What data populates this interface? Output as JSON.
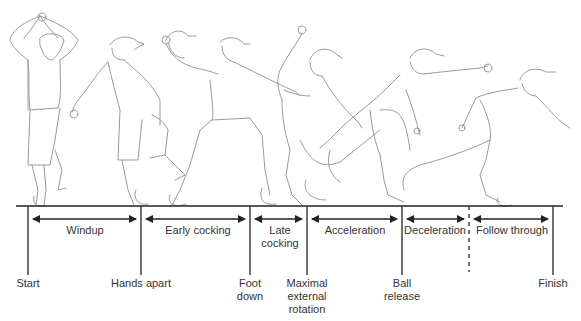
{
  "colors": {
    "line": "#333333",
    "figure_stroke": "#9a9a9a",
    "figure_dark": "#555555",
    "text": "#333333"
  },
  "events": [
    {
      "id": "start",
      "label": "Start",
      "x": 28
    },
    {
      "id": "hands-apart",
      "label": "Hands apart",
      "x": 141
    },
    {
      "id": "foot-down",
      "label_lines": [
        "Foot",
        "down"
      ],
      "x": 250
    },
    {
      "id": "maximal-external-rotation",
      "label_lines": [
        "Maximal",
        "external",
        "rotation"
      ],
      "x": 307
    },
    {
      "id": "ball-release",
      "label_lines": [
        "Ball",
        "release"
      ],
      "x": 402
    },
    {
      "id": "deceleration-end",
      "label": "",
      "x": 469,
      "dashed": true
    },
    {
      "id": "finish",
      "label": "Finish",
      "x": 553
    }
  ],
  "phases": [
    {
      "id": "windup",
      "label": "Windup",
      "from": 28,
      "to": 141
    },
    {
      "id": "early-cocking",
      "label": "Early cocking",
      "from": 141,
      "to": 250
    },
    {
      "id": "late-cocking",
      "label_lines": [
        "Late",
        "cocking"
      ],
      "from": 250,
      "to": 307
    },
    {
      "id": "acceleration",
      "label": "Acceleration",
      "from": 307,
      "to": 402
    },
    {
      "id": "deceleration",
      "label": "Deceleration",
      "from": 402,
      "to": 469
    },
    {
      "id": "follow-through",
      "label": "Follow through",
      "from": 469,
      "to": 553
    }
  ],
  "labels": {
    "windup": "Windup",
    "early_cocking": "Early cocking",
    "late_1": "Late",
    "late_2": "cocking",
    "acceleration": "Acceleration",
    "deceleration": "Deceleration",
    "follow_through": "Follow through",
    "start": "Start",
    "hands_apart": "Hands apart",
    "foot_1": "Foot",
    "foot_2": "down",
    "mer_1": "Maximal",
    "mer_2": "external",
    "mer_3": "rotation",
    "ball_1": "Ball",
    "ball_2": "release",
    "finish": "Finish"
  },
  "figures": [
    {
      "id": "figure-windup",
      "pose": "arms over head, knee raised"
    },
    {
      "id": "figure-hands-apart",
      "pose": "knee lifted, hands separated"
    },
    {
      "id": "figure-early-cocking",
      "pose": "ball arm raised back, stride"
    },
    {
      "id": "figure-late-cocking",
      "pose": "arm in maximal external rotation"
    },
    {
      "id": "figure-ball-release",
      "pose": "arm extended forward"
    },
    {
      "id": "figure-follow-through",
      "pose": "bent forward, arm across"
    }
  ]
}
